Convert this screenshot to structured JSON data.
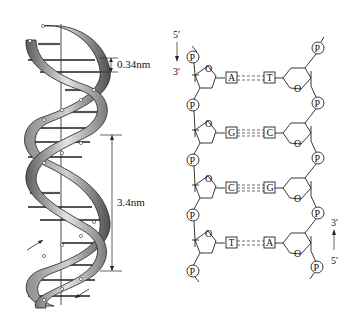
{
  "left_panel": {
    "title": "DNA double helix",
    "dimensions": {
      "base_pair_spacing": "0.34nm",
      "helix_pitch": "3.4nm"
    },
    "strand_direction_arrows": [
      "up",
      "down"
    ]
  },
  "right_panel": {
    "title": "DNA base pairing structure",
    "left_strand": {
      "top_label": "5′",
      "bottom_label": "3′",
      "direction": "down"
    },
    "right_strand": {
      "top_label": "3′",
      "bottom_label": "5′",
      "direction": "up"
    },
    "phosphate_label": "P",
    "sugar_oxygen_label": "O",
    "base_pairs": [
      {
        "left": "A",
        "right": "T",
        "bonds": 2
      },
      {
        "left": "G",
        "right": "C",
        "bonds": 3
      },
      {
        "left": "C",
        "right": "G",
        "bonds": 3
      },
      {
        "left": "T",
        "right": "A",
        "bonds": 2
      }
    ]
  },
  "colors": {
    "ink": "#222222",
    "ribbon_light": "#d8d8d8",
    "ribbon_dark": "#6a6a6a",
    "background": "#ffffff"
  }
}
